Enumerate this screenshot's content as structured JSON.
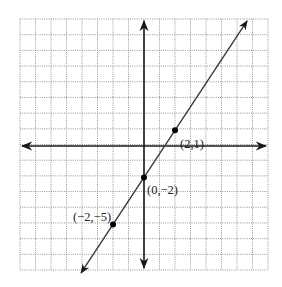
{
  "chart_data": {
    "type": "line",
    "title": "",
    "xlabel": "",
    "ylabel": "",
    "xlim": [
      -8,
      8
    ],
    "ylim": [
      -8,
      8
    ],
    "grid": true,
    "grid_style": "dotted",
    "equation": "y = (3/2)x - 2",
    "slope": 1.5,
    "intercept": -2,
    "series": [
      {
        "name": "line",
        "x": [
          -4.06,
          6.65
        ],
        "y": [
          -8.09,
          7.97
        ],
        "arrows": "both"
      }
    ],
    "points": [
      {
        "x": 2,
        "y": 1,
        "label": "(2,1)"
      },
      {
        "x": 0,
        "y": -2,
        "label": "(0,−2)"
      },
      {
        "x": -2,
        "y": -5,
        "label": "(−2,−5)"
      }
    ]
  },
  "labels": {
    "p1": "(2,1)",
    "p2": "(0,−2)",
    "p3": "(−2,−5)"
  },
  "colors": {
    "grid": "#8a8a8a",
    "axis": "#1a1a1a",
    "line": "#3a3a3a",
    "point": "#000000"
  }
}
